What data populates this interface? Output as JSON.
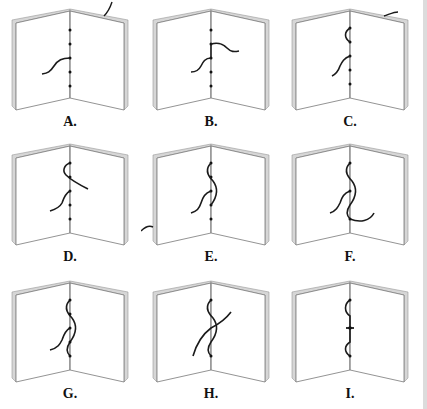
{
  "figure": {
    "colors": {
      "thread": "#1a1a1a",
      "page_outline": "#777777",
      "page_edge": "#bbbbbb",
      "background": "#ffffff"
    },
    "panels": [
      {
        "id": "A",
        "label": "A."
      },
      {
        "id": "B",
        "label": "B."
      },
      {
        "id": "C",
        "label": "C."
      },
      {
        "id": "D",
        "label": "D."
      },
      {
        "id": "E",
        "label": "E."
      },
      {
        "id": "F",
        "label": "F."
      },
      {
        "id": "G",
        "label": "G."
      },
      {
        "id": "H",
        "label": "H."
      },
      {
        "id": "I",
        "label": "I."
      }
    ]
  }
}
